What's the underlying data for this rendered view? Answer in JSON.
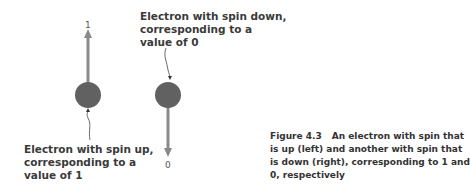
{
  "diagram": {
    "electrons": [
      {
        "id": "spin-up",
        "label": "Electron with spin up,\ncorresponding to a\nvalue of 1",
        "value_label": "1",
        "direction": "up"
      },
      {
        "id": "spin-down",
        "label": "Electron with spin down,\ncorresponding to a\nvalue of 0",
        "value_label": "0",
        "direction": "down"
      }
    ],
    "colors": {
      "electron": "#616161",
      "arrow": "#8a8a8a",
      "text": "#3a3a3a"
    }
  },
  "caption": {
    "figure_number": "Figure 4.3",
    "text": "An electron with spin that is up (left) and another with spin that is down (right), corresponding to 1 and 0, respectively"
  }
}
